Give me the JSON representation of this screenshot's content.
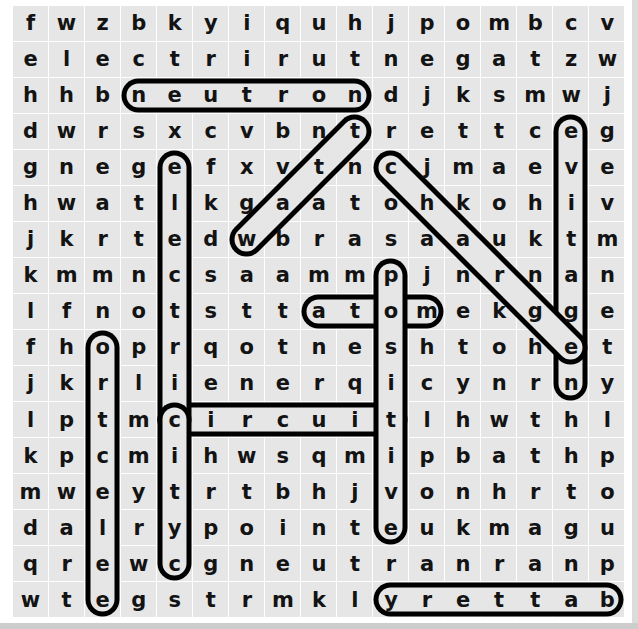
{
  "puzzle": {
    "type": "word-search",
    "rows": 17,
    "cols": 17,
    "cell_size": 36,
    "colors": {
      "cell_background": "#e6e6e6",
      "page_background": "#ffffff",
      "letter": "#131313",
      "highlight_stroke": "#000000"
    },
    "grid": [
      [
        "f",
        "w",
        "z",
        "b",
        "k",
        "y",
        "i",
        "q",
        "u",
        "h",
        "j",
        "p",
        "o",
        "m",
        "b",
        "c",
        "v"
      ],
      [
        "e",
        "l",
        "e",
        "c",
        "t",
        "r",
        "i",
        "r",
        "u",
        "t",
        "n",
        "e",
        "g",
        "a",
        "t",
        "z",
        "w"
      ],
      [
        "h",
        "h",
        "b",
        "n",
        "e",
        "u",
        "t",
        "r",
        "o",
        "n",
        "d",
        "j",
        "k",
        "s",
        "m",
        "w",
        "j"
      ],
      [
        "d",
        "w",
        "r",
        "s",
        "x",
        "c",
        "v",
        "b",
        "n",
        "t",
        "r",
        "e",
        "t",
        "t",
        "c",
        "e",
        "g"
      ],
      [
        "g",
        "n",
        "e",
        "g",
        "e",
        "f",
        "x",
        "v",
        "t",
        "n",
        "c",
        "j",
        "m",
        "a",
        "e",
        "v",
        "e"
      ],
      [
        "h",
        "w",
        "a",
        "t",
        "l",
        "k",
        "g",
        "a",
        "a",
        "t",
        "o",
        "h",
        "k",
        "o",
        "h",
        "i",
        "v"
      ],
      [
        "j",
        "k",
        "r",
        "t",
        "e",
        "d",
        "w",
        "b",
        "r",
        "a",
        "s",
        "a",
        "a",
        "u",
        "k",
        "t",
        "m"
      ],
      [
        "k",
        "m",
        "m",
        "n",
        "c",
        "s",
        "a",
        "a",
        "m",
        "m",
        "p",
        "j",
        "n",
        "r",
        "n",
        "a",
        "n"
      ],
      [
        "l",
        "f",
        "n",
        "o",
        "t",
        "s",
        "t",
        "t",
        "a",
        "t",
        "o",
        "m",
        "e",
        "k",
        "g",
        "g",
        "e"
      ],
      [
        "f",
        "h",
        "o",
        "p",
        "r",
        "q",
        "o",
        "t",
        "n",
        "e",
        "s",
        "h",
        "t",
        "o",
        "h",
        "e",
        "t"
      ],
      [
        "j",
        "k",
        "r",
        "l",
        "i",
        "e",
        "n",
        "e",
        "r",
        "q",
        "i",
        "c",
        "y",
        "n",
        "r",
        "n",
        "y"
      ],
      [
        "l",
        "p",
        "t",
        "m",
        "c",
        "i",
        "r",
        "c",
        "u",
        "i",
        "t",
        "l",
        "h",
        "w",
        "t",
        "h",
        "l"
      ],
      [
        "k",
        "p",
        "c",
        "m",
        "i",
        "h",
        "w",
        "s",
        "q",
        "m",
        "i",
        "p",
        "b",
        "a",
        "t",
        "h",
        "p"
      ],
      [
        "m",
        "w",
        "e",
        "y",
        "t",
        "r",
        "t",
        "b",
        "h",
        "j",
        "v",
        "o",
        "n",
        "h",
        "r",
        "t",
        "o"
      ],
      [
        "d",
        "a",
        "l",
        "r",
        "y",
        "p",
        "o",
        "i",
        "n",
        "t",
        "e",
        "u",
        "k",
        "m",
        "a",
        "g",
        "u"
      ],
      [
        "q",
        "r",
        "e",
        "w",
        "c",
        "g",
        "n",
        "e",
        "u",
        "t",
        "r",
        "a",
        "n",
        "r",
        "a",
        "n",
        "p"
      ],
      [
        "w",
        "t",
        "e",
        "g",
        "s",
        "t",
        "r",
        "m",
        "k",
        "l",
        "y",
        "r",
        "e",
        "t",
        "t",
        "a",
        "b"
      ]
    ],
    "found_words": [
      {
        "word": "neutron",
        "orientation": "horizontal",
        "start": {
          "row": 2,
          "col": 3
        },
        "end": {
          "row": 2,
          "col": 9
        }
      },
      {
        "word": "atom",
        "orientation": "horizontal",
        "start": {
          "row": 8,
          "col": 8
        },
        "end": {
          "row": 8,
          "col": 11
        }
      },
      {
        "word": "circuit",
        "orientation": "horizontal",
        "start": {
          "row": 11,
          "col": 4
        },
        "end": {
          "row": 11,
          "col": 10
        }
      },
      {
        "word": "battery",
        "orientation": "horizontal-reverse",
        "start": {
          "row": 16,
          "col": 10
        },
        "end": {
          "row": 16,
          "col": 16
        }
      },
      {
        "word": "electric",
        "orientation": "vertical",
        "start": {
          "row": 4,
          "col": 4
        },
        "end": {
          "row": 11,
          "col": 4
        }
      },
      {
        "word": "positive",
        "orientation": "vertical",
        "start": {
          "row": 7,
          "col": 10
        },
        "end": {
          "row": 14,
          "col": 10
        }
      },
      {
        "word": "proton",
        "orientation": "vertical-reverse",
        "start": {
          "row": 9,
          "col": 2
        },
        "end": {
          "row": 16,
          "col": 2
        }
      },
      {
        "word": "negative",
        "orientation": "vertical",
        "start": {
          "row": 3,
          "col": 15
        },
        "end": {
          "row": 10,
          "col": 15
        }
      },
      {
        "word": "circuitry",
        "orientation": "vertical",
        "start": {
          "row": 11,
          "col": 4
        },
        "end": {
          "row": 15,
          "col": 4
        }
      },
      {
        "word": "watt",
        "orientation": "diagonal-up-right",
        "start": {
          "row": 6,
          "col": 6
        },
        "end": {
          "row": 3,
          "col": 9
        }
      },
      {
        "word": "charge",
        "orientation": "diagonal-down-right",
        "start": {
          "row": 4,
          "col": 10
        },
        "end": {
          "row": 9,
          "col": 15
        }
      }
    ]
  }
}
